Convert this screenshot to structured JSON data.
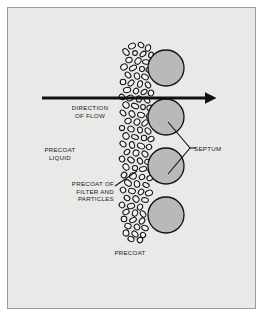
{
  "figure": {
    "title_visible": false,
    "background_color": "#e9e9e7",
    "border_color": "#9a9a9a",
    "ink_color": "#1a1a1a",
    "septum_fill_color": "#b9b9b9",
    "precoat_fill_color": "#f2f2f0"
  },
  "labels": {
    "direction_of_flow": "DIRECTION\nOF FLOW",
    "precoat_liquid": "PRECOAT\nLIQUID",
    "precoat_of_filter_and_particles": "PRECOAT OF\nFILTER AND\nPARTICLES",
    "septum": "SEPTUM",
    "precoat": "PRECOAT"
  },
  "diagram": {
    "flow_arrow": {
      "name": "flow-arrow",
      "direction": "left-to-right",
      "x_start": 42,
      "x_end": 216,
      "y": 98
    },
    "septum_spheres": [
      {
        "cx": 166,
        "cy": 68,
        "r": 18
      },
      {
        "cx": 166,
        "cy": 117,
        "r": 18
      },
      {
        "cx": 166,
        "cy": 166,
        "r": 18
      },
      {
        "cx": 166,
        "cy": 215,
        "r": 18
      }
    ],
    "precoat_band": {
      "name": "precoat-cake-band",
      "x_center": 137,
      "y_top": 42,
      "y_bottom": 242,
      "width": 34
    },
    "leaders": {
      "septum_vertex": {
        "x": 190,
        "y": 148
      },
      "septum_branch_upper_end": {
        "x": 168,
        "y": 122
      },
      "septum_branch_lower_end": {
        "x": 168,
        "y": 174
      },
      "precoat_filter_start": {
        "x": 116,
        "y": 185
      },
      "precoat_filter_end": {
        "x": 136,
        "y": 172
      }
    }
  }
}
